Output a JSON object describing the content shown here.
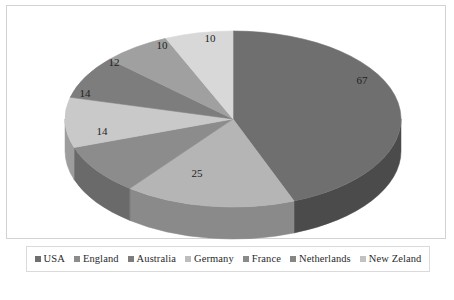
{
  "chart_data": {
    "type": "pie",
    "title": "",
    "subtitle": "",
    "xlabel": "",
    "ylabel": "",
    "three_d": true,
    "start_angle_deg": 0,
    "direction": "clockwise",
    "grid": false,
    "legend_position": "bottom",
    "total": 152,
    "categories": [
      "USA",
      "England",
      "Australia",
      "Germany",
      "France",
      "Netherlands",
      "New Zeland"
    ],
    "values": [
      67,
      25,
      14,
      14,
      12,
      10,
      10
    ],
    "data_labels": [
      "67",
      "25",
      "14",
      "14",
      "12",
      "10",
      "10"
    ],
    "colors": [
      "#6f6f6f",
      "#b5b5b5",
      "#8c8c8c",
      "#c9c9c9",
      "#7d7d7d",
      "#a0a0a0",
      "#d8d8d8"
    ],
    "side_colors": [
      "#4b4b4b",
      "#8a8a8a",
      "#6a6a6a",
      "#9d9d9d",
      "#5e5e5e",
      "#7a7a7a",
      "#a9a9a9"
    ],
    "slices": [
      {
        "label": "USA",
        "value": 67,
        "data_label": "67",
        "color": "#6f6f6f",
        "side_color": "#4b4b4b",
        "start_deg": 0.0,
        "sweep_deg": 158.7,
        "label_x": 355,
        "label_y": 75
      },
      {
        "label": "England",
        "value": 25,
        "data_label": "25",
        "color": "#b5b5b5",
        "side_color": "#8a8a8a",
        "start_deg": 158.7,
        "sweep_deg": 59.2,
        "label_x": 190,
        "label_y": 168
      },
      {
        "label": "Australia",
        "value": 14,
        "data_label": "14",
        "color": "#8c8c8c",
        "side_color": "#6a6a6a",
        "start_deg": 217.9,
        "sweep_deg": 33.2,
        "label_x": 95,
        "label_y": 126
      },
      {
        "label": "Germany",
        "value": 14,
        "data_label": "14",
        "color": "#c9c9c9",
        "side_color": "#9d9d9d",
        "start_deg": 251.1,
        "sweep_deg": 33.2,
        "label_x": 78,
        "label_y": 88
      },
      {
        "label": "France",
        "value": 12,
        "data_label": "12",
        "color": "#7d7d7d",
        "side_color": "#5e5e5e",
        "start_deg": 284.3,
        "sweep_deg": 28.4,
        "label_x": 107,
        "label_y": 57
      },
      {
        "label": "Netherlands",
        "value": 10,
        "data_label": "10",
        "color": "#a0a0a0",
        "side_color": "#7a7a7a",
        "start_deg": 312.7,
        "sweep_deg": 23.7,
        "label_x": 155,
        "label_y": 40
      },
      {
        "label": "New Zeland",
        "value": 10,
        "data_label": "10",
        "color": "#d8d8d8",
        "side_color": "#a9a9a9",
        "start_deg": 336.4,
        "sweep_deg": 23.6,
        "label_x": 203,
        "label_y": 33
      }
    ],
    "geometry": {
      "cx": 226,
      "cy": 113,
      "rx": 168,
      "ry": 88,
      "depth": 32
    }
  },
  "legend": {
    "items": [
      {
        "label": "USA",
        "color": "#6f6f6f"
      },
      {
        "label": "England",
        "color": "#8c8c8c"
      },
      {
        "label": "Australia",
        "color": "#7d7d7d"
      },
      {
        "label": "Germany",
        "color": "#bdbdbd"
      },
      {
        "label": "France",
        "color": "#8a8a8a"
      },
      {
        "label": "Netherlands",
        "color": "#868686"
      },
      {
        "label": "New Zeland",
        "color": "#c2c2c2"
      }
    ]
  }
}
